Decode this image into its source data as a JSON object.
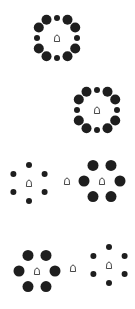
{
  "figure": {
    "dot_color": "#1e1e1e",
    "target_stroke": "#333333"
  },
  "panels": [
    {
      "id": "panel-1",
      "clusters": [
        {
          "cx": 57,
          "cy": 38,
          "ring": "mixed",
          "radius": 20,
          "target": true
        }
      ]
    },
    {
      "id": "panel-2",
      "clusters": [
        {
          "cx": 97,
          "cy": 110,
          "ring": "mixed",
          "radius": 20,
          "target": true
        }
      ]
    },
    {
      "id": "panel-3",
      "clusters": [
        {
          "cx": 29,
          "cy": 183,
          "ring": "small",
          "radius": 18,
          "target": true
        },
        {
          "cx": 67,
          "cy": 181,
          "ring": "none",
          "radius": 0,
          "target": true
        },
        {
          "cx": 102,
          "cy": 181,
          "ring": "large",
          "radius": 18,
          "target": true
        }
      ]
    },
    {
      "id": "panel-4",
      "clusters": [
        {
          "cx": 37,
          "cy": 271,
          "ring": "large",
          "radius": 18,
          "target": true
        },
        {
          "cx": 73,
          "cy": 268,
          "ring": "none",
          "radius": 0,
          "target": true
        },
        {
          "cx": 109,
          "cy": 265,
          "ring": "small",
          "radius": 18,
          "target": true
        }
      ]
    }
  ]
}
